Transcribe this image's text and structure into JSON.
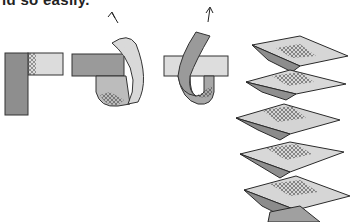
{
  "caption": {
    "text": "ld so easily."
  },
  "illustration": {
    "description": "Paper-strip folding steps and a finished concertina/accordion spring",
    "steps": [
      {
        "name": "step-1-strips-at-right-angle"
      },
      {
        "name": "step-2-fold-strip-over"
      },
      {
        "name": "step-3-fold-second-strip-over"
      }
    ],
    "result": {
      "name": "folded-paper-spring"
    },
    "colors": {
      "dark_strip": "#8a8a8a",
      "light_strip": "#d8d8d8",
      "outline": "#2a2a2a",
      "hatch": "#555555"
    }
  }
}
